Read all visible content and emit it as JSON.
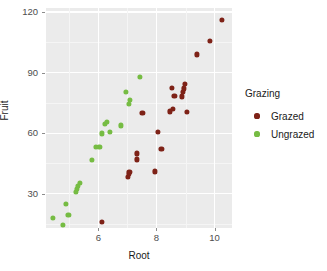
{
  "chart_data": {
    "type": "scatter",
    "title": "",
    "xlabel": "Root",
    "ylabel": "Fruit",
    "xlim": [
      4.2,
      10.6
    ],
    "ylim": [
      13,
      122
    ],
    "xticks": [
      6,
      8,
      10
    ],
    "yticks": [
      30,
      60,
      90,
      120
    ],
    "grid": true,
    "legend_title": "Grazing",
    "legend_position": "right",
    "colors": {
      "Grazed": "#7e2217",
      "Ungrazed": "#76bc43",
      "panel_background": "#ebebeb",
      "gridline_major": "#ffffff",
      "gridline_minor": "#f5f5f5",
      "text": "#1a1a1a",
      "tick_text": "#4d4d4d"
    },
    "series": [
      {
        "name": "Grazed",
        "color": "#7e2217",
        "points": [
          {
            "x": 6.11,
            "y": 16.2
          },
          {
            "x": 7.02,
            "y": 38.2
          },
          {
            "x": 7.05,
            "y": 39.6
          },
          {
            "x": 7.07,
            "y": 40.6
          },
          {
            "x": 7.32,
            "y": 47.0
          },
          {
            "x": 7.33,
            "y": 50.0
          },
          {
            "x": 7.52,
            "y": 70.2
          },
          {
            "x": 7.96,
            "y": 41.0
          },
          {
            "x": 8.05,
            "y": 60.8
          },
          {
            "x": 8.17,
            "y": 52.0
          },
          {
            "x": 8.47,
            "y": 70.8
          },
          {
            "x": 8.52,
            "y": 82.5
          },
          {
            "x": 8.56,
            "y": 72.0
          },
          {
            "x": 8.62,
            "y": 78.3
          },
          {
            "x": 8.88,
            "y": 78.2
          },
          {
            "x": 8.92,
            "y": 80.5
          },
          {
            "x": 8.95,
            "y": 82.2
          },
          {
            "x": 8.97,
            "y": 84.5
          },
          {
            "x": 9.04,
            "y": 70.4
          },
          {
            "x": 9.38,
            "y": 99.0
          },
          {
            "x": 9.84,
            "y": 105.5
          },
          {
            "x": 10.25,
            "y": 116.0
          }
        ]
      },
      {
        "name": "Ungrazed",
        "color": "#76bc43",
        "points": [
          {
            "x": 4.43,
            "y": 17.9
          },
          {
            "x": 4.78,
            "y": 14.7
          },
          {
            "x": 4.89,
            "y": 25.1
          },
          {
            "x": 4.97,
            "y": 19.6
          },
          {
            "x": 5.22,
            "y": 30.9
          },
          {
            "x": 5.26,
            "y": 32.5
          },
          {
            "x": 5.31,
            "y": 34.0
          },
          {
            "x": 5.36,
            "y": 35.5
          },
          {
            "x": 5.78,
            "y": 46.7
          },
          {
            "x": 5.93,
            "y": 53.2
          },
          {
            "x": 6.04,
            "y": 53.0
          },
          {
            "x": 6.13,
            "y": 59.9
          },
          {
            "x": 6.22,
            "y": 64.6
          },
          {
            "x": 6.29,
            "y": 65.5
          },
          {
            "x": 6.39,
            "y": 60.5
          },
          {
            "x": 6.77,
            "y": 63.8
          },
          {
            "x": 6.96,
            "y": 80.5
          },
          {
            "x": 7.05,
            "y": 74.5
          },
          {
            "x": 7.09,
            "y": 76.5
          },
          {
            "x": 7.44,
            "y": 88.0
          }
        ]
      }
    ]
  },
  "legend": {
    "title": "Grazing",
    "items": [
      {
        "label": "Grazed",
        "color": "#7e2217"
      },
      {
        "label": "Ungrazed",
        "color": "#76bc43"
      }
    ]
  },
  "axes": {
    "x": {
      "title": "Root",
      "tick_labels": [
        "6",
        "8",
        "10"
      ]
    },
    "y": {
      "title": "Fruit",
      "tick_labels": [
        "30",
        "60",
        "90",
        "120"
      ]
    }
  }
}
